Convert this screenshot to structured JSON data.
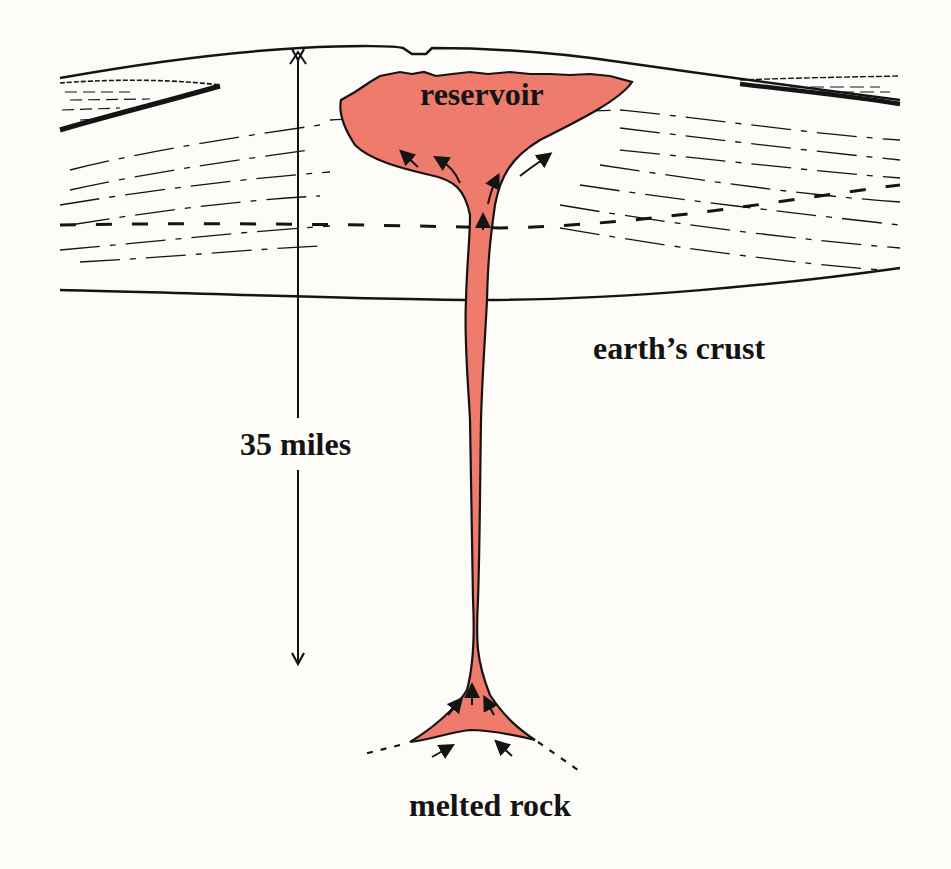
{
  "figure": {
    "type": "cross-section illustration"
  },
  "labels": {
    "reservoir": "reservoir",
    "crust": "earth’s crust",
    "depth": "35 miles",
    "source": "melted rock"
  },
  "colors": {
    "magma": "#ef7b6c",
    "ink": "#141414",
    "paper": "#fdfcf8"
  },
  "elements": {
    "depth_arrow": {
      "direction": "double-headed vertical",
      "represents": "35 miles"
    },
    "flow_arrows": {
      "count": 9,
      "meaning": "direction of magma flow (upward)"
    }
  }
}
